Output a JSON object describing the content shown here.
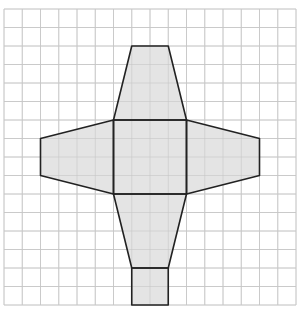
{
  "diagram": {
    "type": "net-on-grid",
    "grid": {
      "origin_x": 4,
      "origin_y": 9,
      "cell_w": 18.25,
      "cell_h": 18.5,
      "cols": 16,
      "rows": 16,
      "line_color": "#d2d2d2"
    },
    "style": {
      "fill": "#e4e4e4",
      "stroke": "#222222",
      "stroke_width": 1.6,
      "fill_opacity": 0.85
    },
    "faces": [
      {
        "name": "top-trapezoid",
        "points": [
          [
            7,
            2
          ],
          [
            9,
            2
          ],
          [
            10,
            6
          ],
          [
            6,
            6
          ]
        ]
      },
      {
        "name": "center-square",
        "points": [
          [
            6,
            6
          ],
          [
            10,
            6
          ],
          [
            10,
            10
          ],
          [
            6,
            10
          ]
        ]
      },
      {
        "name": "left-trapezoid",
        "points": [
          [
            6,
            6
          ],
          [
            2,
            7
          ],
          [
            2,
            9
          ],
          [
            6,
            10
          ]
        ]
      },
      {
        "name": "right-trapezoid",
        "points": [
          [
            10,
            6
          ],
          [
            14,
            7
          ],
          [
            14,
            9
          ],
          [
            10,
            10
          ]
        ]
      },
      {
        "name": "bottom-trapezoid",
        "points": [
          [
            6,
            10
          ],
          [
            10,
            10
          ],
          [
            9,
            14
          ],
          [
            7,
            14
          ]
        ]
      },
      {
        "name": "bottom-square",
        "points": [
          [
            7,
            14
          ],
          [
            9,
            14
          ],
          [
            9,
            16
          ],
          [
            7,
            16
          ]
        ]
      }
    ]
  }
}
